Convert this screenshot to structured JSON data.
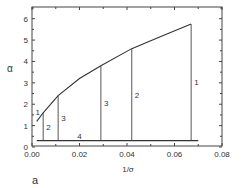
{
  "panel_label": "a",
  "chart_data": {
    "type": "line",
    "title": "",
    "xlabel": "1/σ",
    "ylabel": "α",
    "xlim": [
      0.0,
      0.08
    ],
    "ylim": [
      0,
      6.5
    ],
    "xticks": [
      "0.00",
      "0.02",
      "0.04",
      "0.06",
      "0.08"
    ],
    "yticks": [
      "0",
      "1",
      "2",
      "3",
      "4",
      "5",
      "6"
    ],
    "grid": false,
    "legend": null,
    "series": [
      {
        "name": "1",
        "kind": "curve",
        "x": [
          0.002,
          0.0047,
          0.011,
          0.02,
          0.029,
          0.042,
          0.055,
          0.067
        ],
        "y": [
          1.2,
          1.6,
          2.4,
          3.2,
          3.8,
          4.6,
          5.2,
          5.75
        ]
      },
      {
        "name": "4",
        "kind": "horizontal-line",
        "x": [
          0.002,
          0.07
        ],
        "y": [
          0.3,
          0.3
        ]
      }
    ],
    "vertical_lines": [
      {
        "label": "2",
        "x": 0.0047,
        "y_top": 1.6
      },
      {
        "label": "3",
        "x": 0.011,
        "y_top": 2.4
      },
      {
        "label": "3",
        "x": 0.029,
        "y_top": 3.8
      },
      {
        "label": "2",
        "x": 0.042,
        "y_top": 4.6
      },
      {
        "label": "1",
        "x": 0.067,
        "y_top": 5.75
      }
    ],
    "annotations": [
      "1",
      "2",
      "3",
      "3",
      "2",
      "1",
      "4"
    ]
  }
}
